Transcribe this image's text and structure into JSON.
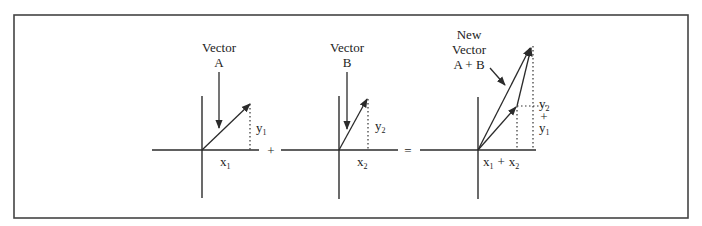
{
  "figure": {
    "panels": [
      {
        "id": "vector-a",
        "title_line1": "Vector",
        "title_line2": "A",
        "x_label": "x",
        "x_sub": "1",
        "y_label": "y",
        "y_sub": "1"
      },
      {
        "id": "vector-b",
        "title_line1": "Vector",
        "title_line2": "B",
        "x_label": "x",
        "x_sub": "2",
        "y_label": "y",
        "y_sub": "2"
      },
      {
        "id": "vector-sum",
        "title_line1": "New",
        "title_line2": "Vector",
        "title_line3": "A + B",
        "x_label_a": "x",
        "x_sub_a": "1",
        "x_plus": "+",
        "x_label_b": "x",
        "x_sub_b": "2",
        "y_label_a": "y",
        "y_sub_a": "2",
        "y_plus": "+",
        "y_label_b": "y",
        "y_sub_b": "1"
      }
    ],
    "operators": {
      "plus": "+",
      "equals": "="
    }
  }
}
